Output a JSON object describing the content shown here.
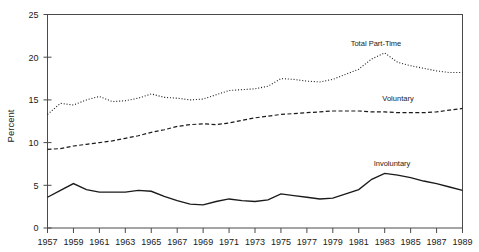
{
  "chart_data": {
    "type": "line",
    "title": "",
    "xlabel": "",
    "ylabel": "Percent",
    "xlim": [
      1957,
      1989
    ],
    "ylim": [
      0,
      25
    ],
    "grid": false,
    "legend_position": "inline-annotations",
    "x": [
      1957,
      1958,
      1959,
      1960,
      1961,
      1962,
      1963,
      1964,
      1965,
      1966,
      1967,
      1968,
      1969,
      1970,
      1971,
      1972,
      1973,
      1974,
      1975,
      1976,
      1977,
      1978,
      1979,
      1980,
      1981,
      1982,
      1983,
      1984,
      1985,
      1986,
      1987,
      1988,
      1989
    ],
    "xtick_labels": [
      "1957",
      "1959",
      "1961",
      "1963",
      "1965",
      "1967",
      "1969",
      "1971",
      "1973",
      "1975",
      "1977",
      "1979",
      "1981",
      "1983",
      "1985",
      "1987",
      "1989"
    ],
    "ytick_labels": [
      "0",
      "5",
      "10",
      "15",
      "20",
      "25"
    ],
    "ytick_values": [
      0,
      5,
      10,
      15,
      20,
      25
    ],
    "series": [
      {
        "name": "Total Part-Time",
        "style": "dotted",
        "label": "Total Part-Time",
        "values": [
          13.3,
          14.6,
          14.4,
          15.0,
          15.4,
          14.8,
          14.9,
          15.2,
          15.7,
          15.3,
          15.2,
          15.0,
          15.1,
          15.6,
          16.1,
          16.2,
          16.3,
          16.6,
          17.5,
          17.4,
          17.2,
          17.1,
          17.4,
          18.0,
          18.6,
          19.8,
          20.5,
          19.4,
          19.0,
          18.7,
          18.4,
          18.2,
          18.2
        ]
      },
      {
        "name": "Voluntary",
        "style": "dashed",
        "label": "Voluntary",
        "values": [
          9.2,
          9.3,
          9.6,
          9.8,
          10.0,
          10.2,
          10.5,
          10.8,
          11.2,
          11.5,
          11.9,
          12.1,
          12.2,
          12.1,
          12.3,
          12.6,
          12.9,
          13.1,
          13.3,
          13.4,
          13.5,
          13.6,
          13.7,
          13.7,
          13.7,
          13.6,
          13.6,
          13.5,
          13.5,
          13.5,
          13.6,
          13.8,
          14.0
        ]
      },
      {
        "name": "Involuntary",
        "style": "solid",
        "label": "Involuntary",
        "values": [
          3.6,
          4.4,
          5.2,
          4.5,
          4.2,
          4.2,
          4.2,
          4.4,
          4.3,
          3.7,
          3.2,
          2.8,
          2.7,
          3.1,
          3.4,
          3.2,
          3.1,
          3.3,
          4.0,
          3.8,
          3.6,
          3.4,
          3.5,
          4.0,
          4.5,
          5.7,
          6.4,
          6.2,
          5.9,
          5.5,
          5.2,
          4.8,
          4.4
        ]
      }
    ]
  },
  "axes": {
    "y_axis_title": "Percent"
  }
}
